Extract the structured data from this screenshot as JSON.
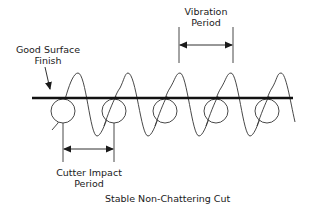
{
  "diagram": {
    "title": "Stable Non-Chattering Cut",
    "labels": {
      "surface_line1": "Good Surface",
      "surface_line2": "Finish",
      "vibration_line1": "Vibration",
      "vibration_line2": "Period",
      "impact_line1": "Cutter Impact",
      "impact_line2": "Period"
    },
    "elements": {
      "surface_line": "thick horizontal workpiece surface",
      "cutter_circles": 5,
      "vibration_wave": "sinusoid in phase with cutter impacts",
      "impact_period_arrow": "double-headed dimension arrow between adjacent cutter centers",
      "vibration_period_arrow": "double-headed dimension arrow between adjacent wave crests"
    },
    "colors": {
      "stroke": "#1a1a1a",
      "background": "#ffffff"
    }
  }
}
